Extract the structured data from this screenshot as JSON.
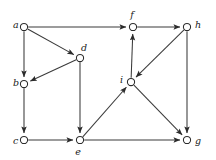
{
  "figure": {
    "kind": "directed-graph",
    "background_color": "#ffffff",
    "edge_color": "#3a3a3a",
    "node_fill_color": "#ffffff",
    "node_stroke_color": "#2b2b2b",
    "label_color": "#1a1a1a",
    "width": 216,
    "height": 160
  },
  "nodes": [
    {
      "id": "a",
      "label": "a",
      "x": 24,
      "y": 27,
      "r": 3.6,
      "label_x": 13,
      "label_y": 25,
      "label_anchor": "start"
    },
    {
      "id": "b",
      "label": "b",
      "x": 24,
      "y": 84,
      "r": 3.6,
      "label_x": 13,
      "label_y": 83,
      "label_anchor": "start"
    },
    {
      "id": "c",
      "label": "c",
      "x": 24,
      "y": 140,
      "r": 3.6,
      "label_x": 13,
      "label_y": 141,
      "label_anchor": "start"
    },
    {
      "id": "d",
      "label": "d",
      "x": 80,
      "y": 58,
      "r": 3.6,
      "label_x": 81,
      "label_y": 48,
      "label_anchor": "start"
    },
    {
      "id": "e",
      "label": "e",
      "x": 80,
      "y": 140,
      "r": 3.6,
      "label_x": 78,
      "label_y": 152,
      "label_anchor": "middle"
    },
    {
      "id": "f",
      "label": "f",
      "x": 133,
      "y": 27,
      "r": 3.6,
      "label_x": 132,
      "label_y": 15,
      "label_anchor": "middle"
    },
    {
      "id": "g",
      "label": "g",
      "x": 187,
      "y": 140,
      "r": 3.6,
      "label_x": 195,
      "label_y": 141,
      "label_anchor": "start"
    },
    {
      "id": "h",
      "label": "h",
      "x": 187,
      "y": 27,
      "r": 3.6,
      "label_x": 195,
      "label_y": 25,
      "label_anchor": "start"
    },
    {
      "id": "i",
      "label": "i",
      "x": 131,
      "y": 82,
      "r": 3.6,
      "label_x": 120,
      "label_y": 80,
      "label_anchor": "start"
    }
  ],
  "edges": [
    {
      "id": "a-f",
      "from": "a",
      "to": "f",
      "directed": true,
      "arrow_at": "to"
    },
    {
      "id": "a-d",
      "from": "a",
      "to": "d",
      "directed": true,
      "arrow_at": "to"
    },
    {
      "id": "a-b",
      "from": "a",
      "to": "b",
      "directed": true,
      "arrow_at": "to"
    },
    {
      "id": "d-b",
      "from": "d",
      "to": "b",
      "directed": true,
      "arrow_at": "to"
    },
    {
      "id": "d-e",
      "from": "d",
      "to": "e",
      "directed": true,
      "arrow_at": "to"
    },
    {
      "id": "b-c",
      "from": "b",
      "to": "c",
      "directed": true,
      "arrow_at": "to"
    },
    {
      "id": "c-e",
      "from": "c",
      "to": "e",
      "directed": true,
      "arrow_at": "to"
    },
    {
      "id": "e-i",
      "from": "e",
      "to": "i",
      "directed": true,
      "arrow_at": "to"
    },
    {
      "id": "e-g",
      "from": "e",
      "to": "g",
      "directed": true,
      "arrow_at": "to"
    },
    {
      "id": "i-f",
      "from": "i",
      "to": "f",
      "directed": true,
      "arrow_at": "to"
    },
    {
      "id": "i-g",
      "from": "i",
      "to": "g",
      "directed": true,
      "arrow_at": "to"
    },
    {
      "id": "h-i",
      "from": "h",
      "to": "i",
      "directed": true,
      "arrow_at": "to"
    },
    {
      "id": "h-g",
      "from": "h",
      "to": "g",
      "directed": true,
      "arrow_at": "to"
    },
    {
      "id": "f-h",
      "from": "f",
      "to": "h",
      "directed": true,
      "arrow_at": "to"
    }
  ]
}
